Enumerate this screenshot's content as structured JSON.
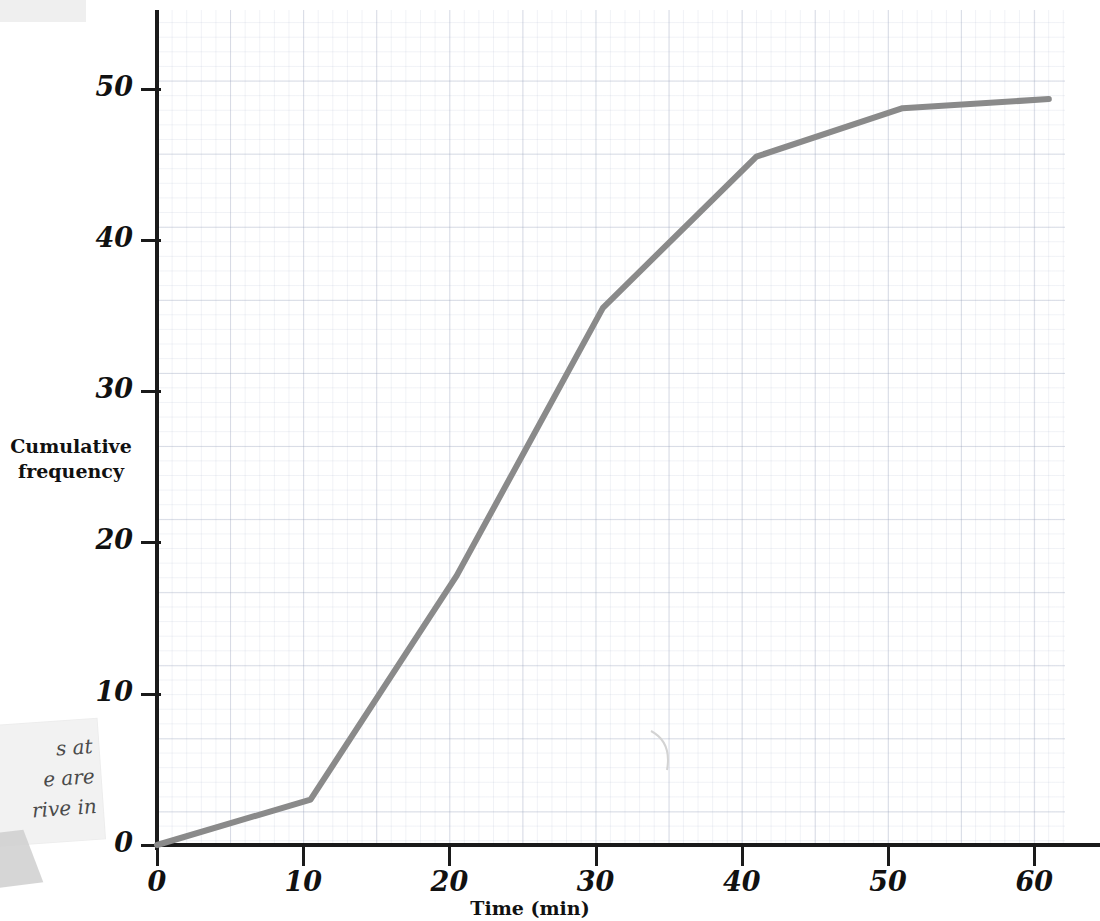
{
  "page": {
    "background_color": "#ffffff",
    "grid_color": "#96a0b9",
    "axis_color": "#1a1a1a",
    "curve_color": "#8a8a8a"
  },
  "annotations": {
    "note": {
      "visible_text": "s at\ne are\nrive in",
      "note_color": "#f2f2f2"
    },
    "scrap_top": {
      "color": "#ececec"
    },
    "pencil_mark": "faint-arc"
  },
  "chart_data": {
    "type": "line",
    "title": "",
    "subtitle": "",
    "xlabel": "Time (min)",
    "ylabel": "Cumulative\nfrequency",
    "ylabel_line1": "Cumulative",
    "ylabel_line2": "frequency",
    "xlim": [
      0,
      62
    ],
    "ylim": [
      0,
      52
    ],
    "xticks": [
      0,
      10,
      20,
      30,
      40,
      50,
      60
    ],
    "xticklabels": [
      "0",
      "10",
      "20",
      "30",
      "40",
      "50",
      "60"
    ],
    "yticks": [
      0,
      10,
      20,
      30,
      40,
      50
    ],
    "yticklabels": [
      "0",
      "10",
      "20",
      "30",
      "40",
      "50"
    ],
    "x_minor_step": 2,
    "y_minor_step": 1,
    "grid": true,
    "legend": false,
    "legend_position": "none",
    "series": [
      {
        "name": "Cumulative frequency",
        "color": "#8a8a8a",
        "line_width": 6,
        "x": [
          0,
          10.5,
          20.5,
          30.5,
          41,
          51,
          61
        ],
        "y": [
          0,
          3,
          17.8,
          35.5,
          45.5,
          48.7,
          49.3
        ]
      }
    ]
  }
}
